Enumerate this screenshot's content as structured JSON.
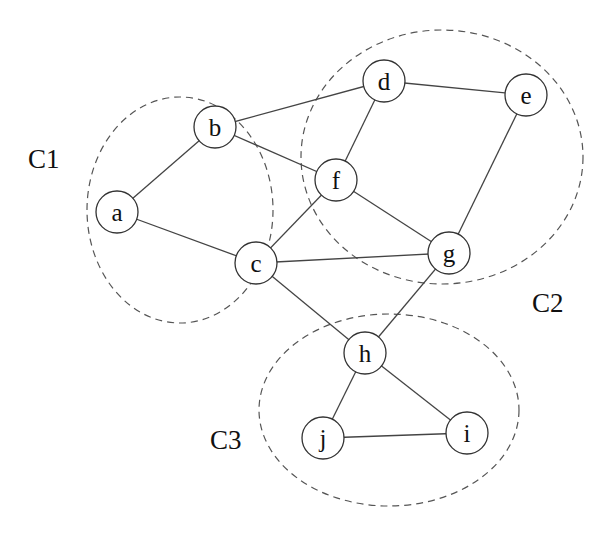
{
  "diagram": {
    "type": "graph-clustering",
    "clusters": [
      {
        "id": "C1",
        "label": "C1",
        "members": [
          "a",
          "b",
          "c"
        ],
        "cx": 180,
        "cy": 210,
        "rx": 93,
        "ry": 113,
        "label_x": 28,
        "label_y": 168
      },
      {
        "id": "C2",
        "label": "C2",
        "members": [
          "d",
          "e",
          "f",
          "g"
        ],
        "cx": 442,
        "cy": 157,
        "rx": 141,
        "ry": 127,
        "label_x": 532,
        "label_y": 312
      },
      {
        "id": "C3",
        "label": "C3",
        "members": [
          "h",
          "i",
          "j"
        ],
        "cx": 389,
        "cy": 410,
        "rx": 130,
        "ry": 96,
        "label_x": 210,
        "label_y": 449
      }
    ],
    "nodes": [
      {
        "id": "a",
        "label": "a",
        "x": 117,
        "y": 212
      },
      {
        "id": "b",
        "label": "b",
        "x": 215,
        "y": 127
      },
      {
        "id": "c",
        "label": "c",
        "x": 256,
        "y": 263
      },
      {
        "id": "d",
        "label": "d",
        "x": 384,
        "y": 81
      },
      {
        "id": "e",
        "label": "e",
        "x": 526,
        "y": 95
      },
      {
        "id": "f",
        "label": "f",
        "x": 336,
        "y": 180
      },
      {
        "id": "g",
        "label": "g",
        "x": 449,
        "y": 253
      },
      {
        "id": "h",
        "label": "h",
        "x": 365,
        "y": 353
      },
      {
        "id": "i",
        "label": "i",
        "x": 467,
        "y": 433
      },
      {
        "id": "j",
        "label": "j",
        "x": 323,
        "y": 438
      }
    ],
    "edges": [
      [
        "a",
        "b"
      ],
      [
        "a",
        "c"
      ],
      [
        "b",
        "d"
      ],
      [
        "b",
        "f"
      ],
      [
        "c",
        "f"
      ],
      [
        "c",
        "g"
      ],
      [
        "c",
        "h"
      ],
      [
        "d",
        "e"
      ],
      [
        "d",
        "f"
      ],
      [
        "e",
        "g"
      ],
      [
        "f",
        "g"
      ],
      [
        "g",
        "h"
      ],
      [
        "h",
        "j"
      ],
      [
        "h",
        "i"
      ],
      [
        "j",
        "i"
      ]
    ],
    "node_radius": 21
  }
}
